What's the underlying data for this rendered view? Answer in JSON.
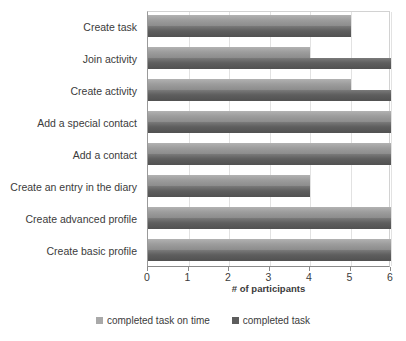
{
  "chart_data": {
    "type": "bar",
    "orientation": "horizontal",
    "title": "",
    "xlabel": "# of participants",
    "ylabel": "",
    "xlim": [
      0,
      6
    ],
    "xticks": [
      "0",
      "1",
      "2",
      "3",
      "4",
      "5",
      "6"
    ],
    "grid": true,
    "legend_position": "bottom",
    "categories": [
      "Create task",
      "Join activity",
      "Create activity",
      "Add a special contact",
      "Add a contact",
      "Create an entry in the diary",
      "Create advanced profile",
      "Create basic profile"
    ],
    "series": [
      {
        "name": "completed task on time",
        "color": "#a9a9a9",
        "values": [
          5,
          4,
          5,
          6,
          6,
          4,
          6,
          6
        ]
      },
      {
        "name": "completed task",
        "color": "#5d5d5d",
        "values": [
          5,
          6,
          6,
          6,
          6,
          4,
          6,
          6
        ]
      }
    ]
  },
  "colors": {
    "background": "#ffffff",
    "text": "#3b3b3b",
    "gridline": "#e2e2e2",
    "axis": "#8a8a8a",
    "series_ontime": "#a9a9a9",
    "series_completed": "#5d5d5d"
  }
}
